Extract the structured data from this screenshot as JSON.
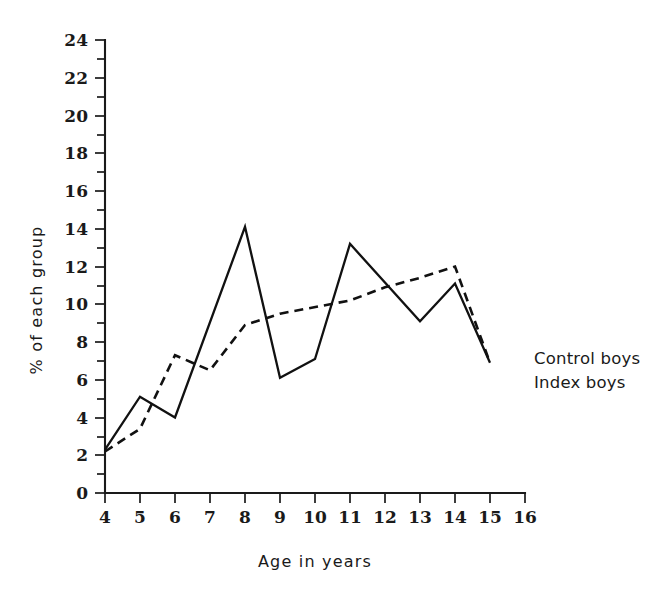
{
  "chart_data": {
    "type": "line",
    "title": "",
    "xlabel": "Age  in  years",
    "ylabel": "% of each group",
    "xlim": [
      4,
      16
    ],
    "ylim": [
      0,
      24
    ],
    "grid": false,
    "legend_position": "right-inline",
    "x_ticks": [
      "4",
      "5",
      "6",
      "7",
      "8",
      "9",
      "10",
      "11",
      "12",
      "13",
      "14",
      "15",
      "16"
    ],
    "y_ticks": [
      "0",
      "2",
      "4",
      "6",
      "8",
      "10",
      "12",
      "14",
      "16",
      "18",
      "20",
      "22",
      "24"
    ],
    "y_minor_tick_step": 1,
    "series": [
      {
        "name": "Control boys",
        "style": "solid",
        "x": [
          4,
          5,
          6,
          8,
          9,
          10,
          11,
          13,
          14,
          15
        ],
        "values": [
          2.3,
          5.1,
          4.0,
          14.1,
          6.1,
          7.1,
          13.2,
          9.1,
          11.1,
          6.9
        ]
      },
      {
        "name": "Index boys",
        "style": "dashed",
        "x": [
          4,
          5,
          6,
          7,
          8,
          9,
          11,
          12,
          13,
          14,
          15
        ],
        "values": [
          2.2,
          3.4,
          7.3,
          6.5,
          8.9,
          9.5,
          10.2,
          10.9,
          11.4,
          12.0,
          6.9
        ]
      }
    ],
    "legend": [
      {
        "label": "Control boys",
        "style": "solid"
      },
      {
        "label": "Index boys",
        "style": "dashed"
      }
    ]
  },
  "colors": {
    "ink": "#1a1a1a",
    "background": "#ffffff"
  }
}
